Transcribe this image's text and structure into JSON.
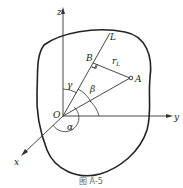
{
  "figure": {
    "caption": "图 A-5",
    "axes": {
      "x": "x",
      "y": "y",
      "z": "z"
    },
    "points": {
      "origin": "O",
      "A": "A",
      "B": "B"
    },
    "line_label": "L",
    "distance_label": "r",
    "distance_subscript": "L",
    "angles": {
      "alpha": "α",
      "beta": "β",
      "gamma": "γ"
    }
  }
}
